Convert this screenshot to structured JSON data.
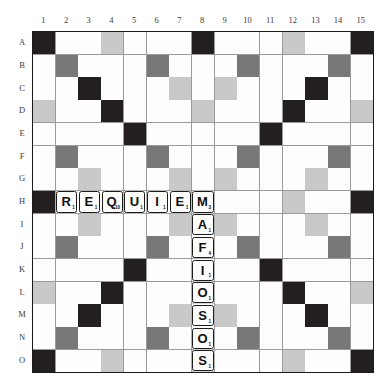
{
  "board": {
    "name": "scrabble-board",
    "size": 15,
    "col_headers": [
      "1",
      "2",
      "3",
      "4",
      "5",
      "6",
      "7",
      "8",
      "9",
      "10",
      "11",
      "12",
      "13",
      "14",
      "15"
    ],
    "row_headers": [
      "A",
      "B",
      "C",
      "D",
      "E",
      "F",
      "G",
      "H",
      "I",
      "J",
      "K",
      "L",
      "M",
      "N",
      "O"
    ],
    "colors": {
      "triple_word": "#231f20",
      "double_word": "#787878",
      "triple_letter": "#c9c9c9",
      "double_letter": "#dededc",
      "plain": "#fdfdfd",
      "gridline": "#9a9a9a",
      "border": "#1a1a1a",
      "tile_face": "#fcfcfa",
      "tile_border": "#1b1b1b"
    },
    "premium_layout": [
      [
        "tw",
        "",
        "",
        "tl",
        "",
        "",
        "",
        "tw",
        "",
        "",
        "",
        "tl",
        "",
        "",
        "tw"
      ],
      [
        "",
        "dw",
        "",
        "",
        "",
        "dw",
        "",
        "",
        "",
        "dw",
        "",
        "",
        "",
        "dw",
        ""
      ],
      [
        "",
        "",
        "tw",
        "",
        "",
        "",
        "tl",
        "",
        "tl",
        "",
        "",
        "",
        "tw",
        "",
        ""
      ],
      [
        "tl",
        "",
        "",
        "tw",
        "",
        "",
        "",
        "tl",
        "",
        "",
        "",
        "tw",
        "",
        "",
        "tl"
      ],
      [
        "",
        "",
        "",
        "",
        "tw",
        "",
        "",
        "",
        "",
        "",
        "tw",
        "",
        "",
        "",
        ""
      ],
      [
        "",
        "dw",
        "",
        "",
        "",
        "dw",
        "",
        "",
        "",
        "dw",
        "",
        "",
        "",
        "dw",
        ""
      ],
      [
        "",
        "",
        "tl",
        "",
        "",
        "",
        "tl",
        "",
        "tl",
        "",
        "",
        "",
        "tl",
        "",
        ""
      ],
      [
        "tw",
        "",
        "",
        "",
        "",
        "",
        "",
        "",
        "",
        "",
        "",
        "tl",
        "",
        "",
        "tw"
      ],
      [
        "",
        "",
        "tl",
        "",
        "",
        "",
        "tl",
        "",
        "tl",
        "",
        "",
        "",
        "tl",
        "",
        ""
      ],
      [
        "",
        "dw",
        "",
        "",
        "",
        "dw",
        "",
        "",
        "",
        "dw",
        "",
        "",
        "",
        "dw",
        ""
      ],
      [
        "",
        "",
        "",
        "",
        "tw",
        "",
        "",
        "",
        "",
        "",
        "tw",
        "",
        "",
        "",
        ""
      ],
      [
        "tl",
        "",
        "",
        "tw",
        "",
        "",
        "",
        "tl",
        "",
        "",
        "",
        "tw",
        "",
        "",
        "tl"
      ],
      [
        "",
        "",
        "tw",
        "",
        "",
        "",
        "tl",
        "",
        "tl",
        "",
        "",
        "",
        "tw",
        "",
        ""
      ],
      [
        "",
        "dw",
        "",
        "",
        "",
        "dw",
        "",
        "",
        "",
        "dw",
        "",
        "",
        "",
        "dw",
        ""
      ],
      [
        "tw",
        "",
        "",
        "tl",
        "",
        "",
        "",
        "tl",
        "",
        "",
        "",
        "tl",
        "",
        "",
        "tw"
      ]
    ]
  },
  "words": [
    {
      "text": "REQUIEM",
      "orientation": "horizontal",
      "row": "H",
      "start_col": 2,
      "end_col": 8
    },
    {
      "text": "MAFIOSOS",
      "orientation": "vertical",
      "col": 8,
      "start_row": "H",
      "end_row": "O"
    }
  ],
  "tiles": [
    {
      "row": 7,
      "col": 1,
      "letter": "R",
      "points": "1"
    },
    {
      "row": 7,
      "col": 2,
      "letter": "E",
      "points": "1"
    },
    {
      "row": 7,
      "col": 3,
      "letter": "Q",
      "points": "10"
    },
    {
      "row": 7,
      "col": 4,
      "letter": "U",
      "points": "1"
    },
    {
      "row": 7,
      "col": 5,
      "letter": "I",
      "points": "1"
    },
    {
      "row": 7,
      "col": 6,
      "letter": "E",
      "points": "1"
    },
    {
      "row": 7,
      "col": 7,
      "letter": "M",
      "points": "3"
    },
    {
      "row": 8,
      "col": 7,
      "letter": "A",
      "points": "1"
    },
    {
      "row": 9,
      "col": 7,
      "letter": "F",
      "points": "4"
    },
    {
      "row": 10,
      "col": 7,
      "letter": "I",
      "points": "1"
    },
    {
      "row": 11,
      "col": 7,
      "letter": "O",
      "points": "1"
    },
    {
      "row": 12,
      "col": 7,
      "letter": "S",
      "points": "1"
    },
    {
      "row": 13,
      "col": 7,
      "letter": "O",
      "points": "1"
    },
    {
      "row": 14,
      "col": 7,
      "letter": "S",
      "points": "1"
    }
  ]
}
